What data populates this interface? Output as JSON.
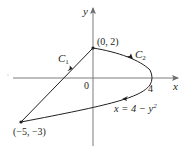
{
  "figure": {
    "axes": {
      "x_label": "x",
      "y_label": "y",
      "origin_label": "0",
      "x_tick_label": "4"
    },
    "points": [
      {
        "label": "(0, 2)",
        "x": 0,
        "y": 2
      },
      {
        "label": "(−5, −3)",
        "x": -5,
        "y": -3
      }
    ],
    "curves": [
      {
        "name": "C",
        "subscript": "1",
        "description": "line segment from (−5, −3) to (0, 2)"
      },
      {
        "name": "C",
        "subscript": "2",
        "description": "arc of parabola x = 4 − y² from (0, 2) to (−5, −3)"
      }
    ],
    "equation": {
      "lhs": "x = 4 − y",
      "exponent": "2"
    },
    "colors": {
      "ink": "#231f20",
      "axis": "#6d6e71"
    }
  }
}
